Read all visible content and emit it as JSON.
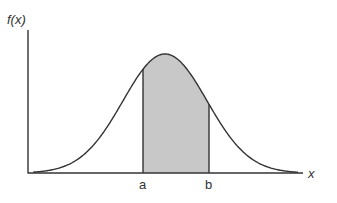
{
  "chart_data": {
    "type": "area",
    "title": "",
    "ylabel": "f(x)",
    "xlabel": "x",
    "curve": "normal",
    "shaded_region": {
      "from": "a",
      "to": "b",
      "color": "#c8c8c8"
    },
    "x_ticks": [
      "a",
      "b"
    ],
    "grid": false,
    "legend": null
  },
  "labels": {
    "y_axis": "f(x)",
    "x_axis": "x",
    "a": "a",
    "b": "b"
  },
  "colors": {
    "line": "#333333",
    "fill": "#c8c8c8",
    "background": "#ffffff"
  }
}
